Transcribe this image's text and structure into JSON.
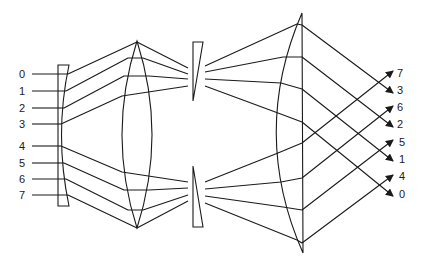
{
  "diagram": {
    "title": "",
    "input_labels": [
      "0",
      "1",
      "2",
      "3",
      "4",
      "5",
      "6",
      "7"
    ],
    "output_labels": [
      "7",
      "3",
      "6",
      "2",
      "5",
      "1",
      "4",
      "0"
    ],
    "components": [
      {
        "id": "input-plate",
        "label": ""
      },
      {
        "id": "biconvex-lens",
        "label": ""
      },
      {
        "id": "upper-wedge-prism",
        "label": ""
      },
      {
        "id": "lower-wedge-prism",
        "label": ""
      },
      {
        "id": "plano-convex-lens",
        "label": ""
      }
    ],
    "stroke_color": "#1a1a1a",
    "background": "#ffffff"
  }
}
